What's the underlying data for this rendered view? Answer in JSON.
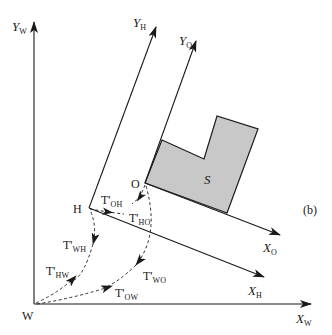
{
  "figure": {
    "panel_label": "(b)",
    "colors": {
      "line": "#1a1a1a",
      "shape_fill": "#c8c8c8",
      "shape_stroke": "#1a1a1a",
      "background": "#ffffff"
    },
    "frames": [
      {
        "id": "W",
        "origin_label": "W",
        "x_axis": {
          "main": "X",
          "sub": "W"
        },
        "y_axis": {
          "main": "Y",
          "sub": "W"
        }
      },
      {
        "id": "H",
        "origin_label": "H",
        "x_axis": {
          "main": "X",
          "sub": "H"
        },
        "y_axis": {
          "main": "Y",
          "sub": "H"
        }
      },
      {
        "id": "O",
        "origin_label": "O",
        "x_axis": {
          "main": "X",
          "sub": "O"
        },
        "y_axis": {
          "main": "Y",
          "sub": "O"
        }
      }
    ],
    "shape": {
      "label": "S"
    },
    "transforms": [
      {
        "id": "OH",
        "main": "T'",
        "sub": "OH",
        "from": "O",
        "to": "H"
      },
      {
        "id": "HO",
        "main": "T'",
        "sub": "HO",
        "from": "H",
        "to": "O"
      },
      {
        "id": "WH",
        "main": "T'",
        "sub": "WH",
        "from": "H",
        "to": "W"
      },
      {
        "id": "HW",
        "main": "T'",
        "sub": "HW",
        "from": "W",
        "to": "H"
      },
      {
        "id": "WO",
        "main": "T'",
        "sub": "WO",
        "from": "O",
        "to": "W"
      },
      {
        "id": "OW",
        "main": "T'",
        "sub": "OW",
        "from": "W",
        "to": "O"
      }
    ]
  }
}
